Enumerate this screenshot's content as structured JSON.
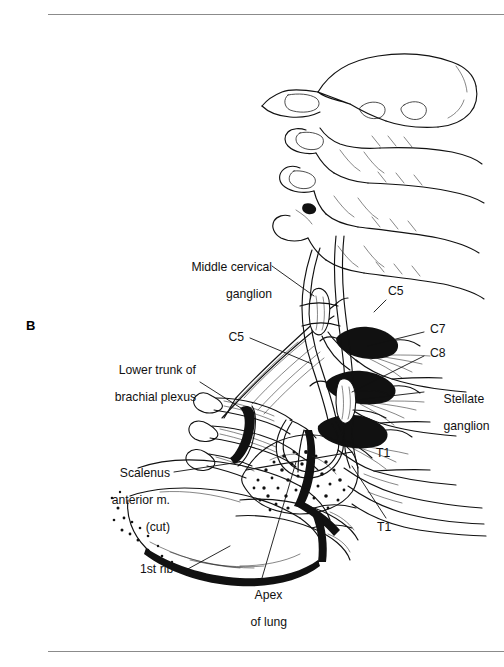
{
  "figure": {
    "panel_letter": "B",
    "rules": {
      "top": "horizontal-rule",
      "bottom": "horizontal-rule"
    }
  },
  "labels": {
    "middle_cervical_ganglion": {
      "line1": "Middle cervical",
      "line2": "ganglion"
    },
    "c5_left": "C5",
    "c5_right": "C5",
    "c7": "C7",
    "c8": "C8",
    "stellate_ganglion": {
      "line1": "Stellate",
      "line2": "ganglion"
    },
    "lower_trunk": {
      "line1": "Lower trunk of",
      "line2": "brachial plexus"
    },
    "scalenus_anterior": {
      "line1": "Scalenus",
      "line2": "anterior m.",
      "line3": "(cut)"
    },
    "t1_upper": "T1",
    "t1_lower": "T1",
    "first_rib": "1st rib",
    "apex_of_lung": {
      "line1": "Apex",
      "line2": "of lung"
    }
  },
  "colors": {
    "ink": "#111111",
    "rule": "#8b8b8b",
    "background": "#ffffff"
  }
}
